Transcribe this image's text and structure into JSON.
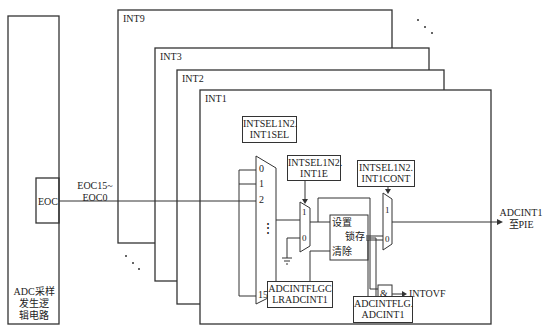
{
  "diagram": {
    "adc_block": {
      "label_lines": [
        "ADC采样",
        "发生逻",
        "辑电路"
      ],
      "eoc_label": "EOC"
    },
    "signal_bus": {
      "label_lines": [
        "EOC15~",
        "EOC0"
      ]
    },
    "interrupt_layers": [
      {
        "name": "INT9"
      },
      {
        "name": "INT3"
      },
      {
        "name": "INT2"
      },
      {
        "name": "INT1"
      }
    ],
    "registers": {
      "int_sel": [
        "INTSEL1N2.",
        "INT1SEL"
      ],
      "int_enable": [
        "INTSEL1N2.",
        "INT1E"
      ],
      "int_cont": [
        "INTSEL1N2.",
        "INT1CONT"
      ],
      "flag_clear": [
        "ADCINTFLGC",
        "LRADCINT1"
      ],
      "flag": [
        "ADCINTFLG.",
        "ADCINT1"
      ]
    },
    "mux16": {
      "inputs": [
        "0",
        "1",
        "2",
        "⋮",
        "15"
      ]
    },
    "mux_enable": {
      "inputs": [
        "1",
        "0"
      ]
    },
    "mux_cont": {
      "inputs": [
        "1",
        "0"
      ]
    },
    "latch": {
      "set": "设置",
      "latch": "锁存",
      "clear": "清除"
    },
    "and_gate": {
      "symbol": "&",
      "output": "INTOVF"
    },
    "output": {
      "label_lines": [
        "ADCINT1",
        "至PIE"
      ]
    },
    "ellipsis": "..."
  }
}
